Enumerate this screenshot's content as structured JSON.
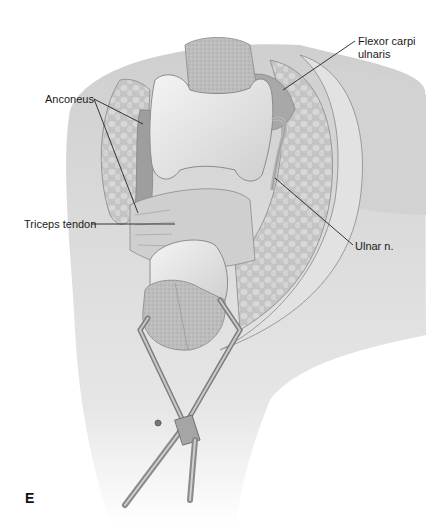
{
  "figure": {
    "panel_letter": "E",
    "labels": [
      {
        "id": "flexor",
        "line1": "Flexor carpi",
        "line2": "ulnaris"
      },
      {
        "id": "anconeus",
        "line1": "Anconeus"
      },
      {
        "id": "triceps",
        "line1": "Triceps tendon"
      },
      {
        "id": "ulnar",
        "line1": "Ulnar n."
      }
    ],
    "colors": {
      "background": "#ffffff",
      "label_text": "#1a1a1a",
      "leader_line": "#222222",
      "bone_light": "#e8e8e8",
      "bone_cut": "#b9b9b9",
      "muscle": "#9a9a9a",
      "skin": "#d6d6d6",
      "instrument": "#8c8c8c"
    }
  }
}
